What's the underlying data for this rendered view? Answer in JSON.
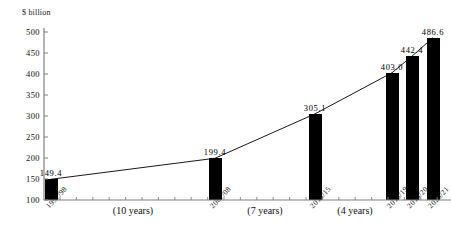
{
  "chart_data": {
    "type": "bar",
    "title": "",
    "subtitle": "",
    "xlabel": "",
    "ylabel": "$ billion",
    "ylim": [
      100,
      500
    ],
    "ytick_step": 50,
    "yticks": [
      100,
      150,
      200,
      250,
      300,
      350,
      400,
      450,
      500
    ],
    "grid": false,
    "legend": "none",
    "categories": [
      "1997/98",
      "2007/08",
      "2014/15",
      "2018/19",
      "2019/20",
      "2020/21"
    ],
    "values": [
      149.4,
      199.4,
      305.1,
      403.0,
      442.4,
      486.6
    ],
    "value_labels": [
      "149.4",
      "199.4",
      "305.1",
      "403.0",
      "442.4",
      "486.6"
    ],
    "series": [
      {
        "name": "value",
        "values": [
          149.4,
          199.4,
          305.1,
          403.0,
          442.4,
          486.6
        ]
      }
    ],
    "overlay_line": {
      "type": "line",
      "connects": "bar-tops",
      "values": [
        149.4,
        199.4,
        305.1,
        403.0,
        442.4,
        486.6
      ]
    },
    "annotations": [
      {
        "text": "(10 years)",
        "between": [
          "1997/98",
          "2007/08"
        ]
      },
      {
        "text": "(7 years)",
        "between": [
          "2007/08",
          "2014/15"
        ]
      },
      {
        "text": "(4 years)",
        "between": [
          "2014/15",
          "2018/19"
        ]
      }
    ],
    "colors": {
      "bar": "#000000",
      "line": "#000000",
      "axis": "#808080",
      "text": "#111111",
      "background": "#ffffff"
    }
  },
  "axis": {
    "y_title": "$ billion"
  }
}
